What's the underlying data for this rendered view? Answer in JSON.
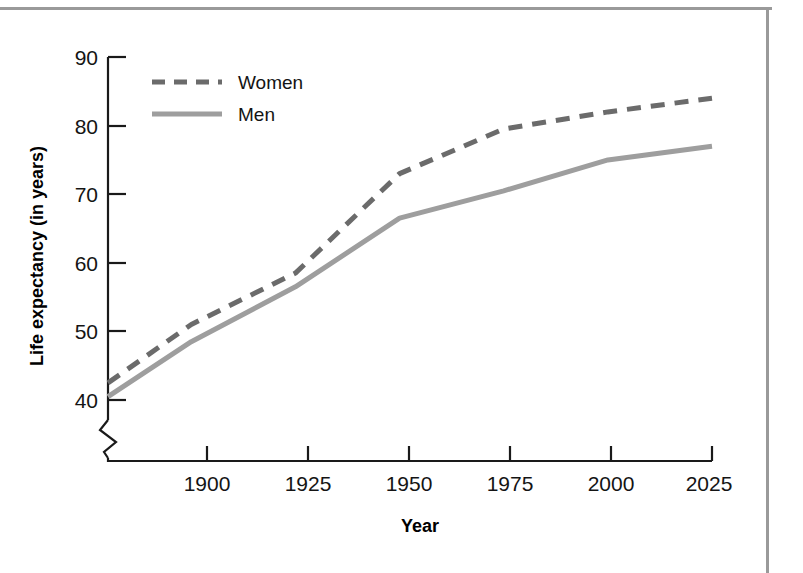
{
  "figure": {
    "name": "life-expectancy-line-chart",
    "background_color": "#ffffff",
    "frame_color": "#9a9a9a"
  },
  "chart_data": {
    "type": "line",
    "title": "",
    "xlabel": "Year",
    "ylabel": "Life expectancy (in years)",
    "x": [
      1880,
      1900,
      1925,
      1950,
      1975,
      2000,
      2025
    ],
    "xticks": [
      1900,
      1925,
      1950,
      1975,
      2000,
      2025
    ],
    "xtick_labels": [
      "1900",
      "1925",
      "1950",
      "1975",
      "2000",
      "2025"
    ],
    "yticks": [
      40,
      50,
      60,
      70,
      80,
      90
    ],
    "ytick_labels": [
      "40",
      "50",
      "60",
      "70",
      "80",
      "90"
    ],
    "xlim": [
      1880,
      2025
    ],
    "ylim": [
      40,
      90
    ],
    "grid": false,
    "y_axis_break": true,
    "x_axis_break": true,
    "legend_position": "upper left",
    "series": [
      {
        "name": "Women",
        "style": "dashed",
        "color": "#6b6b6b",
        "values": [
          42.5,
          51.0,
          58.5,
          73.0,
          79.5,
          82.0,
          84.0
        ]
      },
      {
        "name": "Men",
        "style": "solid",
        "color": "#9e9e9e",
        "values": [
          40.5,
          48.5,
          56.5,
          66.5,
          70.5,
          75.0,
          77.0
        ]
      }
    ]
  },
  "legend": {
    "entries": [
      {
        "label": "Women",
        "style": "dashed",
        "color": "#6b6b6b"
      },
      {
        "label": "Men",
        "style": "solid",
        "color": "#9e9e9e"
      }
    ]
  },
  "axes": {
    "y_title": "Life expectancy (in years)",
    "x_title": "Year"
  }
}
